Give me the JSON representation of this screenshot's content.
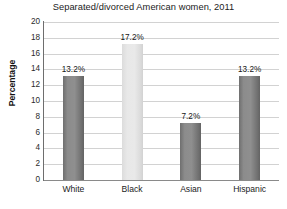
{
  "chart_data": {
    "type": "bar",
    "title": "Separated/divorced American women, 2011",
    "xlabel": "",
    "ylabel": "Percentage",
    "categories": [
      "White",
      "Black",
      "Asian",
      "Hispanic"
    ],
    "values": [
      13.2,
      17.2,
      7.2,
      13.2
    ],
    "value_labels": [
      "13.2%",
      "17.2%",
      "7.2%",
      "13.2%"
    ],
    "bar_colors": [
      "#8a8a8a",
      "#e4e4e4",
      "#8a8a8a",
      "#8a8a8a"
    ],
    "ylim": [
      0,
      20
    ],
    "yticks": [
      20,
      18,
      16,
      14,
      12,
      10,
      8,
      6,
      4,
      2,
      0
    ],
    "ytick_labels": [
      "20",
      "18",
      "16",
      "14",
      "12",
      "10",
      "8",
      "6",
      "4",
      "2",
      "0"
    ],
    "grid": true,
    "grid_color": "#d2d2d2",
    "legend": null,
    "legend_position": "none",
    "background_color": "#ffffff",
    "axis_color": "#6e6e6e",
    "text_color": "#1b1b1b"
  }
}
